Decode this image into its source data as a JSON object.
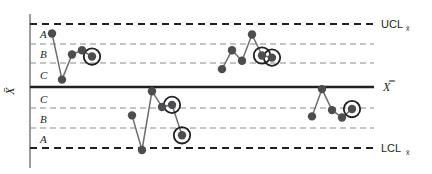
{
  "chart_data": {
    "type": "line",
    "title": "",
    "subtitle": "",
    "xlabel": "",
    "ylabel": "X̄",
    "ylabel_plain": "X-bar",
    "grid": true,
    "legend_position": "none",
    "y_axis": {
      "unit": "sigma",
      "ylim": [
        -3.6,
        3.6
      ],
      "tick_values": [
        3,
        2,
        1,
        0,
        -1,
        -2,
        -3
      ],
      "tick_labels": [
        "UCL",
        "",
        "",
        "CL",
        "",
        "",
        "LCL"
      ]
    },
    "reference_lines": [
      {
        "name": "UCL",
        "label": "UCL",
        "sublabel": "x̄",
        "sigma": 3,
        "style": "dashed-heavy",
        "color": "#231f20"
      },
      {
        "name": "zone-A-B-upper",
        "label": "",
        "sublabel": "",
        "sigma": 2,
        "style": "dashed-light",
        "color": "#8c8c8c"
      },
      {
        "name": "zone-B-C-upper",
        "label": "",
        "sublabel": "",
        "sigma": 1,
        "style": "dashed-light",
        "color": "#8c8c8c"
      },
      {
        "name": "CL",
        "label": "X̿",
        "sublabel": "",
        "sigma": 0,
        "style": "solid-heavy",
        "color": "#231f20"
      },
      {
        "name": "zone-C-B-lower",
        "label": "",
        "sublabel": "",
        "sigma": -1,
        "style": "dashed-light",
        "color": "#8c8c8c"
      },
      {
        "name": "zone-B-A-lower",
        "label": "",
        "sublabel": "",
        "sigma": -2,
        "style": "dashed-light",
        "color": "#8c8c8c"
      },
      {
        "name": "LCL",
        "label": "LCL",
        "sublabel": "x̄",
        "sigma": -3,
        "style": "dashed-heavy",
        "color": "#231f20"
      }
    ],
    "zones": [
      {
        "label": "A",
        "position": "upper",
        "sigma_from": 2,
        "sigma_to": 3
      },
      {
        "label": "B",
        "position": "upper",
        "sigma_from": 1,
        "sigma_to": 2
      },
      {
        "label": "C",
        "position": "upper",
        "sigma_from": 0,
        "sigma_to": 1
      },
      {
        "label": "C",
        "position": "lower",
        "sigma_from": -1,
        "sigma_to": 0
      },
      {
        "label": "B",
        "position": "lower",
        "sigma_from": -2,
        "sigma_to": -1
      },
      {
        "label": "A",
        "position": "lower",
        "sigma_from": -3,
        "sigma_to": -2
      }
    ],
    "series": [
      {
        "name": "run-1",
        "color": "#6d6e71",
        "marker_color": "#4d4d4f",
        "points": [
          {
            "x": 1,
            "y": 2.55,
            "flagged": false
          },
          {
            "x": 2,
            "y": 0.35,
            "flagged": false
          },
          {
            "x": 3,
            "y": 1.55,
            "flagged": false
          },
          {
            "x": 4,
            "y": 1.75,
            "flagged": false
          },
          {
            "x": 5,
            "y": 1.45,
            "flagged": true
          }
        ]
      },
      {
        "name": "run-2",
        "color": "#6d6e71",
        "marker_color": "#4d4d4f",
        "points": [
          {
            "x": 9,
            "y": -1.35,
            "flagged": false
          },
          {
            "x": 10,
            "y": -3.0,
            "flagged": false
          },
          {
            "x": 11,
            "y": -0.2,
            "flagged": false
          },
          {
            "x": 12,
            "y": -0.95,
            "flagged": false
          },
          {
            "x": 13,
            "y": -0.85,
            "flagged": true
          },
          {
            "x": 14,
            "y": -2.3,
            "flagged": true
          }
        ]
      },
      {
        "name": "run-3",
        "color": "#6d6e71",
        "marker_color": "#4d4d4f",
        "points": [
          {
            "x": 18,
            "y": 0.85,
            "flagged": false
          },
          {
            "x": 19,
            "y": 1.75,
            "flagged": false
          },
          {
            "x": 20,
            "y": 1.25,
            "flagged": false
          },
          {
            "x": 21,
            "y": 2.5,
            "flagged": false
          },
          {
            "x": 22,
            "y": 1.5,
            "flagged": true
          },
          {
            "x": 23,
            "y": 1.4,
            "flagged": true
          }
        ]
      },
      {
        "name": "run-4",
        "color": "#6d6e71",
        "marker_color": "#4d4d4f",
        "points": [
          {
            "x": 27,
            "y": -1.4,
            "flagged": false
          },
          {
            "x": 28,
            "y": -0.1,
            "flagged": false
          },
          {
            "x": 29,
            "y": -1.1,
            "flagged": false
          },
          {
            "x": 30,
            "y": -1.45,
            "flagged": false
          },
          {
            "x": 31,
            "y": -1.05,
            "flagged": true
          }
        ]
      }
    ],
    "flag_marker": {
      "name": "violation-circle",
      "shape": "circle-outline",
      "color": "#231f20"
    },
    "annotations": []
  },
  "labels": {
    "y_axis_label": "X̄",
    "center_line_label": "X̿",
    "ucl_text": "UCL",
    "ucl_subscript": "x̄",
    "lcl_text": "LCL",
    "lcl_subscript": "x̄",
    "zone_a_upper": "A",
    "zone_b_upper": "B",
    "zone_c_upper": "C",
    "zone_c_lower": "C",
    "zone_b_lower": "B",
    "zone_a_lower": "A"
  },
  "colors": {
    "background": "#ffffff",
    "axis": "#808285",
    "heavy_line": "#231f20",
    "light_line": "#8c8c8c",
    "series_line": "#6d6e71",
    "marker_fill": "#4d4d4f",
    "flag_ring": "#231f20"
  },
  "geometry": {
    "width": 432,
    "height": 174,
    "axis_x": 30,
    "plot_left": 30,
    "plot_right": 374,
    "plot_top": 14,
    "plot_bottom": 168,
    "y_ucl": 24,
    "y_zone_ab_upper": 44,
    "y_zone_bc_upper": 63,
    "y_center": 87,
    "y_zone_cb_lower": 108,
    "y_zone_ba_lower": 128,
    "y_lcl": 148
  }
}
